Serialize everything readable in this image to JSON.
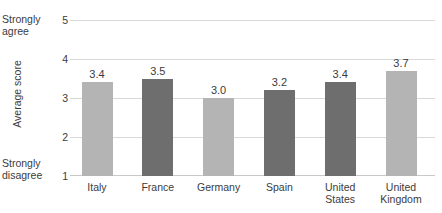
{
  "chart_data": {
    "type": "bar",
    "title": "",
    "xlabel": "",
    "ylabel": "Average score",
    "ylim": [
      1,
      5
    ],
    "yticks": [
      "1",
      "2",
      "3",
      "4",
      "5"
    ],
    "grid": true,
    "legend": "none",
    "scale_anchor_high": "Strongly agree",
    "scale_anchor_low": "Strongly disagree",
    "categories": [
      "Italy",
      "France",
      "Germany",
      "Spain",
      "United States",
      "United Kingdom"
    ],
    "values": [
      3.4,
      3.5,
      3.0,
      3.2,
      3.4,
      3.7
    ],
    "value_labels": [
      "3.4",
      "3.5",
      "3.0",
      "3.2",
      "3.4",
      "3.7"
    ],
    "bar_colors": [
      "#b4b4b4",
      "#6e6e6e",
      "#b4b4b4",
      "#6e6e6e",
      "#6e6e6e",
      "#b4b4b4"
    ],
    "colors": {
      "light_bar": "#b4b4b4",
      "dark_bar": "#6e6e6e",
      "gridline": "#d9d9d9",
      "text": "#3b3b3b",
      "background": "#ffffff"
    }
  }
}
